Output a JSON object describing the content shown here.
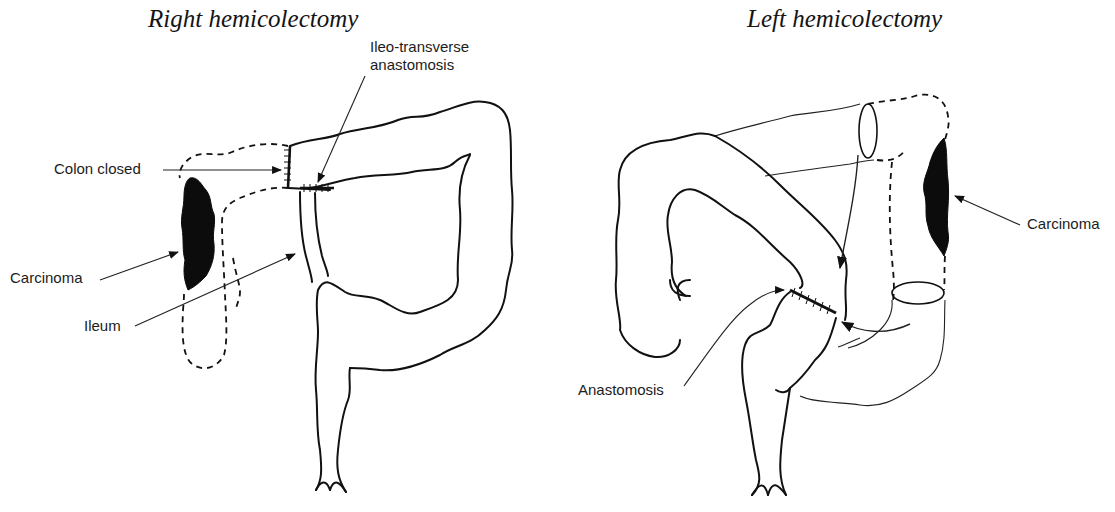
{
  "figure": {
    "panels": [
      {
        "title": "Right hemicolectomy",
        "labels": {
          "ileo_transverse": [
            "Ileo-transverse",
            "anastomosis"
          ],
          "colon_closed": "Colon closed",
          "carcinoma": "Carcinoma",
          "ileum": "Ileum"
        }
      },
      {
        "title": "Left hemicolectomy",
        "labels": {
          "carcinoma": "Carcinoma",
          "anastomosis": "Anastomosis"
        }
      }
    ]
  }
}
